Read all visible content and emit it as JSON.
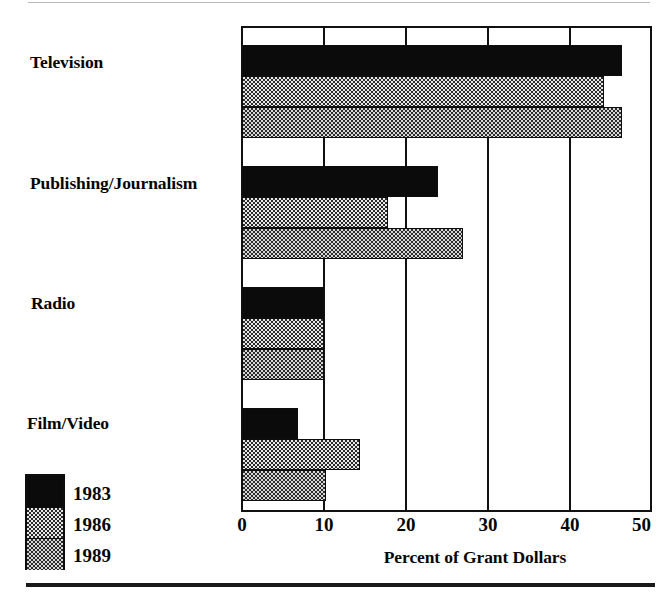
{
  "chart_data": {
    "type": "bar",
    "orientation": "horizontal",
    "title": "",
    "xlabel": "Percent of Grant Dollars",
    "ylabel": "",
    "categories": [
      "Television",
      "Publishing/Journalism",
      "Radio",
      "Film/Video"
    ],
    "series": [
      {
        "name": "1983",
        "fill": "solid-black",
        "values": [
          46.5,
          24.0,
          10.0,
          6.8
        ]
      },
      {
        "name": "1986",
        "fill": "light-checker",
        "values": [
          44.3,
          17.8,
          10.0,
          14.4
        ]
      },
      {
        "name": "1989",
        "fill": "dark-checker",
        "values": [
          46.5,
          27.0,
          10.0,
          10.2
        ]
      }
    ],
    "xticks": [
      0,
      10,
      20,
      30,
      40,
      50
    ],
    "xtick_labels": [
      "0",
      "10",
      "20",
      "30",
      "40",
      "50"
    ],
    "xlim": [
      0,
      50
    ],
    "grid": "vertical-only",
    "legend_position": "bottom-left",
    "legend_entries": [
      "1983",
      "1986",
      "1989"
    ],
    "colors": {
      "bar_1983": "#0b0b0b",
      "bar_1986": "#e8e8e8",
      "bar_1989": "#2b2b2b",
      "axis": "#111111",
      "text": "#070707",
      "background": "#ffffff"
    }
  },
  "axis": {
    "xlabel_text": "Percent of Grant Dollars",
    "ticks": [
      "0",
      "10",
      "20",
      "30",
      "40",
      "50"
    ]
  },
  "categories": {
    "c0": "Television",
    "c1": "Publishing/Journalism",
    "c2": "Radio",
    "c3": "Film/Video"
  },
  "legend": {
    "e0": "1983",
    "e1": "1986",
    "e2": "1989"
  }
}
